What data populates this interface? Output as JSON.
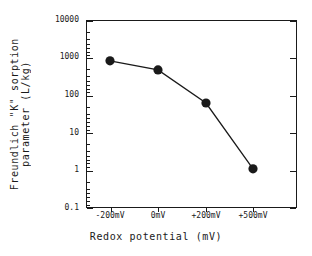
{
  "chart_data": {
    "type": "line",
    "title": "",
    "xlabel": "Redox potential (mV)",
    "ylabel": "Freundlich \"K\" sorption parameter (L/kg)",
    "ylabel_line1": "Freundlich \"K\" sorption",
    "ylabel_line2": "parameter (L/kg)",
    "yscale": "log",
    "ylim": [
      0.1,
      10000
    ],
    "grid": false,
    "legend": "none",
    "marker": "filled-circle",
    "categories": [
      "-200mV",
      "0mV",
      "+200mV",
      "+500mV"
    ],
    "x_numeric": [
      -200,
      0,
      200,
      500
    ],
    "values": [
      820,
      470,
      62,
      1.1
    ],
    "y_ticks": [
      "0.1",
      "1",
      "10",
      "100",
      "1000",
      "10000"
    ],
    "y_tick_values": [
      0.1,
      1,
      10,
      100,
      1000,
      10000
    ],
    "x_tick_labels": [
      "-200mV",
      "0mV",
      "+200mV",
      "+500mV"
    ],
    "series": [
      {
        "name": "Freundlich K",
        "values": [
          820,
          470,
          62,
          1.1
        ]
      }
    ],
    "colors": {
      "line": "#1a1a1a",
      "marker": "#1a1a1a",
      "axis": "#1a1a1a",
      "background": "#ffffff"
    }
  }
}
